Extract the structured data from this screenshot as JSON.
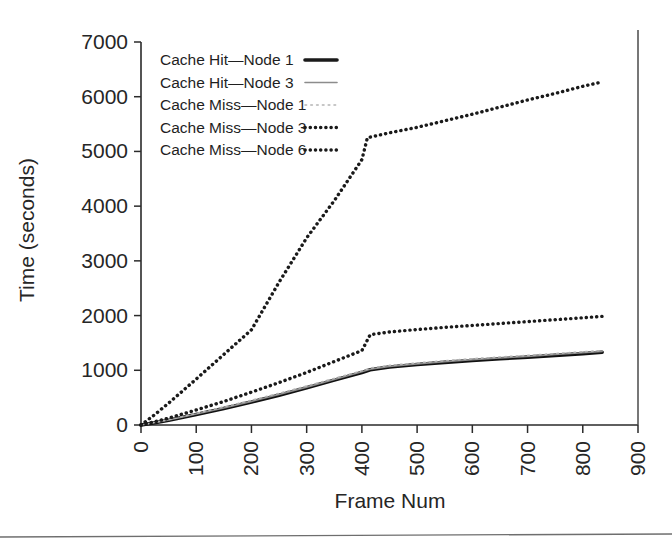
{
  "chart_data": {
    "type": "line",
    "title": "",
    "xlabel": "Frame Num",
    "ylabel": "Time (seconds)",
    "xlim": [
      0,
      900
    ],
    "ylim": [
      0,
      7000
    ],
    "xticks": [
      0,
      100,
      200,
      300,
      400,
      500,
      600,
      700,
      800,
      900
    ],
    "yticks": [
      0,
      1000,
      2000,
      3000,
      4000,
      5000,
      6000,
      7000
    ],
    "xtick_labels": [
      "0",
      "100",
      "200",
      "300",
      "400",
      "500",
      "600",
      "700",
      "800",
      "900"
    ],
    "ytick_labels": [
      "0",
      "1000",
      "2000",
      "3000",
      "4000",
      "5000",
      "6000",
      "7000"
    ],
    "grid": false,
    "legend_position": "upper left inside",
    "series": [
      {
        "name": "Cache Hit—Node 1",
        "style": "solid-thick",
        "color": "#111111",
        "x": [
          0,
          25,
          50,
          100,
          150,
          200,
          250,
          300,
          350,
          400,
          415,
          450,
          500,
          550,
          600,
          650,
          700,
          750,
          800,
          835
        ],
        "y": [
          0,
          40,
          85,
          190,
          300,
          420,
          545,
          680,
          820,
          960,
          1010,
          1060,
          1105,
          1145,
          1180,
          1210,
          1240,
          1272,
          1305,
          1330
        ]
      },
      {
        "name": "Cache Hit—Node 3",
        "style": "solid-thin",
        "color": "#8c8c8c",
        "x": [
          0,
          25,
          50,
          100,
          150,
          200,
          250,
          300,
          350,
          400,
          415,
          450,
          500,
          550,
          600,
          650,
          700,
          750,
          800,
          835
        ],
        "y": [
          0,
          45,
          92,
          200,
          312,
          432,
          558,
          692,
          832,
          972,
          1020,
          1072,
          1118,
          1158,
          1194,
          1224,
          1254,
          1288,
          1320,
          1345
        ]
      },
      {
        "name": "Cache Miss—Node 1",
        "style": "dotted-light",
        "color": "#b4b4b4",
        "x": [
          0,
          25,
          50,
          100,
          150,
          200,
          250,
          300,
          350,
          400,
          415,
          450,
          500,
          550,
          600,
          650,
          700,
          750,
          800,
          835
        ],
        "y": [
          0,
          48,
          98,
          212,
          330,
          452,
          580,
          712,
          852,
          990,
          1040,
          1090,
          1135,
          1175,
          1212,
          1242,
          1272,
          1305,
          1338,
          1362
        ]
      },
      {
        "name": "Cache Miss—Node 3",
        "style": "dotted-bold",
        "color": "#1a1a1a",
        "x": [
          0,
          25,
          50,
          100,
          150,
          200,
          250,
          300,
          350,
          400,
          415,
          450,
          500,
          550,
          600,
          650,
          700,
          750,
          800,
          835
        ],
        "y": [
          0,
          60,
          125,
          275,
          430,
          600,
          775,
          960,
          1160,
          1360,
          1650,
          1700,
          1745,
          1785,
          1820,
          1855,
          1890,
          1925,
          1960,
          1985
        ]
      },
      {
        "name": "Cache Miss—Node 6",
        "style": "dotted-bold",
        "color": "#1a1a1a",
        "x": [
          0,
          25,
          50,
          100,
          150,
          200,
          250,
          300,
          350,
          400,
          410,
          450,
          500,
          550,
          600,
          650,
          700,
          750,
          800,
          835
        ],
        "y": [
          0,
          190,
          400,
          840,
          1290,
          1740,
          2610,
          3420,
          4100,
          4850,
          5250,
          5340,
          5440,
          5560,
          5680,
          5810,
          5940,
          6060,
          6190,
          6270
        ]
      }
    ]
  },
  "legend": {
    "items": [
      {
        "label": "Cache Hit—Node 1",
        "sample": "solid-thick"
      },
      {
        "label": "Cache Hit—Node 3",
        "sample": "solid-thin"
      },
      {
        "label": "Cache Miss—Node 1",
        "sample": "dotted-light"
      },
      {
        "label": "Cache Miss—Node 3",
        "sample": "dotted-bold"
      },
      {
        "label": "Cache Miss—Node 6",
        "sample": "dotted-bold"
      }
    ]
  },
  "colors": {
    "background": "#ffffff",
    "axis": "#2b2b2b",
    "text": "#262626",
    "series_dark": "#1a1a1a",
    "series_gray": "#8c8c8c",
    "series_light": "#b4b4b4"
  }
}
